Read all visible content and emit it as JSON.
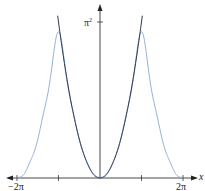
{
  "chart_data": {
    "type": "line",
    "title": "",
    "xlabel": "x",
    "ylabel": "",
    "xlim": [
      -6.6,
      6.8
    ],
    "ylim": [
      0,
      10.5
    ],
    "grid": false,
    "legend": null,
    "x_ticks": [
      {
        "value": -6.2832,
        "label": "−2π"
      },
      {
        "value": -3.1416,
        "label": ""
      },
      {
        "value": 3.1416,
        "label": ""
      },
      {
        "value": 6.2832,
        "label": "2π"
      }
    ],
    "y_ticks": [
      {
        "value": 9.8696,
        "label": "π²"
      }
    ],
    "series": [
      {
        "name": "x^2 on [-π, π]",
        "color": "#2a3550",
        "domain": [
          -3.1416,
          3.1416
        ],
        "description": "parabola y = x², reaching π² at x = ±π",
        "x": [
          -3.1416,
          -2.5,
          -2.0,
          -1.5,
          -1.0,
          -0.5,
          0,
          0.5,
          1.0,
          1.5,
          2.0,
          2.5,
          3.1416
        ],
        "y": [
          9.87,
          6.25,
          4.0,
          2.25,
          1.0,
          0.25,
          0,
          0.25,
          1.0,
          2.25,
          4.0,
          6.25,
          9.87
        ]
      },
      {
        "name": "Fourier partial sum of periodic x^2",
        "color": "#8fb0d8",
        "domain": [
          -6.2832,
          6.2832
        ],
        "description": "π²/3 + Σ 4(−1)^n cos(nx)/n², peaks slightly below π² near ±π, zero at 0 and ±2π",
        "x": [
          -6.2832,
          -5.5,
          -4.5,
          -3.1416,
          -2.0,
          -1.0,
          0,
          1.0,
          2.0,
          3.1416,
          4.5,
          5.5,
          6.2832
        ],
        "y": [
          0.0,
          0.6,
          3.2,
          9.2,
          4.0,
          1.0,
          0.0,
          1.0,
          4.0,
          9.2,
          3.2,
          0.6,
          0.0
        ]
      }
    ]
  },
  "labels": {
    "x_axis": "x",
    "pi_squared": "π",
    "pi_squared_exp": "2",
    "neg_two_pi": "−2π",
    "two_pi": "2π"
  }
}
